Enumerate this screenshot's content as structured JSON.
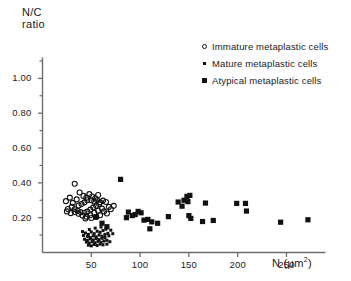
{
  "chart_data": {
    "type": "scatter",
    "title": "",
    "xlabel": "N (μm2)",
    "xlabel_base": "N  (μm",
    "xlabel_sup": "2",
    "xlabel_close": ")",
    "ylabel_line1": "N/C",
    "ylabel_line2": "ratio",
    "xlim": [
      0,
      290
    ],
    "ylim": [
      0,
      1.12
    ],
    "grid": false,
    "legend_position": "top-right",
    "xticks": [
      50,
      100,
      150,
      200,
      250
    ],
    "xtick_labels": [
      "50",
      "100",
      "150",
      "200",
      "250"
    ],
    "yticks": [
      0.2,
      0.4,
      0.6,
      0.8,
      1.0
    ],
    "ytick_labels": [
      "0.20",
      "0.40",
      "0.60",
      "0.80",
      "1.00"
    ],
    "yminor_ticks": [
      0.1,
      0.3,
      0.5,
      0.7,
      0.9,
      1.1
    ],
    "axis_color": "#6e6e6e",
    "marker_color": "#111111",
    "series": [
      {
        "name": "Immature metaplastic cells",
        "marker": "open-circle",
        "points": [
          [
            33,
            0.395
          ],
          [
            28,
            0.315
          ],
          [
            24,
            0.295
          ],
          [
            31,
            0.285
          ],
          [
            38,
            0.345
          ],
          [
            35,
            0.305
          ],
          [
            42,
            0.325
          ],
          [
            45,
            0.315
          ],
          [
            48,
            0.335
          ],
          [
            51,
            0.322
          ],
          [
            54,
            0.312
          ],
          [
            57,
            0.33
          ],
          [
            50,
            0.3
          ],
          [
            53,
            0.292
          ],
          [
            56,
            0.3
          ],
          [
            59,
            0.288
          ],
          [
            46,
            0.3
          ],
          [
            43,
            0.288
          ],
          [
            40,
            0.278
          ],
          [
            37,
            0.27
          ],
          [
            30,
            0.262
          ],
          [
            26,
            0.25
          ],
          [
            33,
            0.248
          ],
          [
            36,
            0.24
          ],
          [
            39,
            0.232
          ],
          [
            43,
            0.228
          ],
          [
            46,
            0.235
          ],
          [
            49,
            0.246
          ],
          [
            52,
            0.258
          ],
          [
            55,
            0.268
          ],
          [
            58,
            0.278
          ],
          [
            62,
            0.298
          ],
          [
            65,
            0.29
          ],
          [
            68,
            0.262
          ],
          [
            61,
            0.252
          ],
          [
            57,
            0.24
          ],
          [
            53,
            0.228
          ],
          [
            49,
            0.214
          ],
          [
            45,
            0.206
          ],
          [
            41,
            0.212
          ],
          [
            37,
            0.222
          ],
          [
            33,
            0.232
          ],
          [
            29,
            0.226
          ],
          [
            25,
            0.236
          ],
          [
            63,
            0.236
          ],
          [
            66,
            0.224
          ],
          [
            59,
            0.214
          ],
          [
            55,
            0.204
          ],
          [
            50,
            0.198
          ],
          [
            44,
            0.196
          ],
          [
            70,
            0.248
          ],
          [
            73,
            0.268
          ]
        ]
      },
      {
        "name": "Mature metaplastic cells",
        "marker": "dot",
        "points": [
          [
            44,
            0.112
          ],
          [
            47,
            0.104
          ],
          [
            50,
            0.118
          ],
          [
            53,
            0.108
          ],
          [
            56,
            0.122
          ],
          [
            59,
            0.116
          ],
          [
            62,
            0.126
          ],
          [
            65,
            0.134
          ],
          [
            46,
            0.092
          ],
          [
            49,
            0.086
          ],
          [
            52,
            0.096
          ],
          [
            55,
            0.09
          ],
          [
            58,
            0.1
          ],
          [
            61,
            0.094
          ],
          [
            64,
            0.104
          ],
          [
            67,
            0.11
          ],
          [
            43,
            0.076
          ],
          [
            46,
            0.07
          ],
          [
            49,
            0.078
          ],
          [
            52,
            0.072
          ],
          [
            55,
            0.08
          ],
          [
            58,
            0.074
          ],
          [
            61,
            0.082
          ],
          [
            64,
            0.086
          ],
          [
            45,
            0.06
          ],
          [
            48,
            0.054
          ],
          [
            51,
            0.062
          ],
          [
            54,
            0.056
          ],
          [
            57,
            0.064
          ],
          [
            60,
            0.058
          ],
          [
            63,
            0.066
          ],
          [
            66,
            0.07
          ],
          [
            47,
            0.042
          ],
          [
            50,
            0.038
          ],
          [
            53,
            0.046
          ],
          [
            56,
            0.04
          ],
          [
            59,
            0.048
          ],
          [
            62,
            0.044
          ],
          [
            68,
            0.096
          ],
          [
            70,
            0.128
          ],
          [
            42,
            0.098
          ],
          [
            41,
            0.12
          ],
          [
            69,
            0.062
          ],
          [
            66,
            0.048
          ],
          [
            54,
            0.14
          ],
          [
            60,
            0.146
          ],
          [
            48,
            0.132
          ],
          [
            72,
            0.108
          ]
        ]
      },
      {
        "name": "Atypical metaplastic cells",
        "marker": "square",
        "points": [
          [
            80,
            0.42
          ],
          [
            55,
            0.205
          ],
          [
            61,
            0.168
          ],
          [
            66,
            0.148
          ],
          [
            88,
            0.232
          ],
          [
            86,
            0.2
          ],
          [
            92,
            0.212
          ],
          [
            95,
            0.218
          ],
          [
            98,
            0.236
          ],
          [
            101,
            0.228
          ],
          [
            104,
            0.186
          ],
          [
            108,
            0.19
          ],
          [
            112,
            0.176
          ],
          [
            110,
            0.136
          ],
          [
            118,
            0.168
          ],
          [
            129,
            0.206
          ],
          [
            139,
            0.29
          ],
          [
            143,
            0.266
          ],
          [
            145,
            0.3
          ],
          [
            148,
            0.322
          ],
          [
            151,
            0.328
          ],
          [
            149,
            0.292
          ],
          [
            150,
            0.212
          ],
          [
            152,
            0.196
          ],
          [
            164,
            0.178
          ],
          [
            167,
            0.284
          ],
          [
            175,
            0.184
          ],
          [
            199,
            0.282
          ],
          [
            208,
            0.282
          ],
          [
            209,
            0.238
          ],
          [
            244,
            0.174
          ],
          [
            272,
            0.188
          ]
        ]
      }
    ]
  },
  "legend": {
    "items": [
      {
        "label": "Immature metaplastic cells",
        "marker": "open-circle"
      },
      {
        "label": "Mature metaplastic cells",
        "marker": "dot"
      },
      {
        "label": "Atypical metaplastic cells",
        "marker": "square"
      }
    ]
  }
}
